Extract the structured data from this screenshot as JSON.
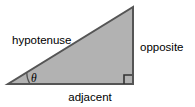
{
  "figure": {
    "background_color": "#ffffff",
    "shape": {
      "name": "right-triangle",
      "fill_color": "#b2b2b2",
      "stroke_color": "#555555",
      "stroke_width": 2,
      "vertices": {
        "left": [
          8,
          84
        ],
        "bottom_right": [
          133,
          84
        ],
        "apex": [
          133,
          7
        ]
      }
    },
    "angle_mark": {
      "symbol": "θ",
      "label_x": 31,
      "label_y": 82,
      "arc_radius": 22,
      "stroke_color": "#555555"
    },
    "right_angle_mark": {
      "name": "right-angle-square",
      "size": 9,
      "stroke_color": "#333333"
    },
    "labels": {
      "hypotenuse": {
        "text": "hypotenuse",
        "x": 12,
        "y": 44,
        "anchor": "start"
      },
      "opposite": {
        "text": "opposite",
        "x": 140,
        "y": 51,
        "anchor": "start"
      },
      "adjacent": {
        "text": "adjacent",
        "x": 90,
        "y": 101,
        "anchor": "middle"
      }
    }
  }
}
